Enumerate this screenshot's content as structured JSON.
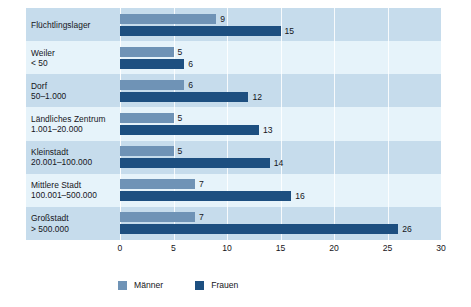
{
  "chart_data": {
    "type": "bar",
    "orientation": "horizontal",
    "title": "",
    "subtitle": "",
    "xlabel": "",
    "ylabel": "",
    "xlim": [
      0,
      30
    ],
    "xticks": [
      "0",
      "5",
      "10",
      "15",
      "20",
      "25",
      "30"
    ],
    "grid": true,
    "legend_position": "bottom",
    "categories": [
      {
        "line1": "Flüchtlingslager",
        "line2": ""
      },
      {
        "line1": "Weiler",
        "line2": "< 50"
      },
      {
        "line1": "Dorf",
        "line2": "50–1.000"
      },
      {
        "line1": "Ländliches Zentrum",
        "line2": "1.001–20.000"
      },
      {
        "line1": "Kleinstadt",
        "line2": "20.001–100.000"
      },
      {
        "line1": "Mittlere Stadt",
        "line2": "100.001–500.000"
      },
      {
        "line1": "Großstadt",
        "line2": "> 500.000"
      }
    ],
    "series": [
      {
        "name": "Männer",
        "color": "#6f93b6",
        "values": [
          9,
          5,
          6,
          5,
          5,
          7,
          7
        ]
      },
      {
        "name": "Frauen",
        "color": "#1d4f80",
        "values": [
          15,
          6,
          12,
          13,
          14,
          16,
          26
        ]
      }
    ]
  },
  "legend": {
    "items": [
      {
        "label": "Männer",
        "color": "#6f93b6"
      },
      {
        "label": "Frauen",
        "color": "#1d4f80"
      }
    ]
  },
  "colors": {
    "maenner": "#6f93b6",
    "frauen": "#1d4f80",
    "band_a": "#c6dcec",
    "band_b": "#e6f3fa",
    "text": "#15151a",
    "gridline": "#ffffff"
  }
}
